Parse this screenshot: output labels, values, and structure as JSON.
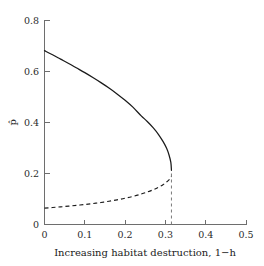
{
  "chart_data": {
    "type": "line",
    "title": "",
    "xlabel": "Increasing habitat destruction, 1−h",
    "ylabel": "p̂",
    "xlim": [
      0,
      0.5
    ],
    "ylim": [
      0,
      0.8
    ],
    "xticks": [
      0,
      0.1,
      0.2,
      0.3,
      0.4,
      0.5
    ],
    "xtick_labels": [
      "0",
      "0.1",
      "0.2",
      "0.3",
      "0.4",
      "0.5"
    ],
    "yticks": [
      0,
      0.2,
      0.4,
      0.6,
      0.8
    ],
    "ytick_labels": [
      "0",
      "0.2",
      "0.4",
      "0.6",
      "0.8"
    ],
    "grid": false,
    "legend": null,
    "annotations": [],
    "fold_point": {
      "x": 0.315,
      "y": 0.212
    },
    "series": [
      {
        "name": "stable equilibrium",
        "style": "solid",
        "color": "#1a1a1a",
        "x": [
          0.0,
          0.02,
          0.04,
          0.06,
          0.08,
          0.1,
          0.12,
          0.14,
          0.16,
          0.18,
          0.2,
          0.22,
          0.24,
          0.255,
          0.27,
          0.283,
          0.294,
          0.303,
          0.309,
          0.3135,
          0.315
        ],
        "y": [
          0.68,
          0.664,
          0.647,
          0.63,
          0.612,
          0.594,
          0.575,
          0.555,
          0.534,
          0.511,
          0.486,
          0.458,
          0.425,
          0.403,
          0.378,
          0.352,
          0.325,
          0.298,
          0.272,
          0.243,
          0.212
        ]
      },
      {
        "name": "unstable equilibrium",
        "style": "dashed",
        "color": "#1a1a1a",
        "x": [
          0.0,
          0.02,
          0.04,
          0.06,
          0.08,
          0.1,
          0.12,
          0.14,
          0.16,
          0.18,
          0.2,
          0.22,
          0.24,
          0.255,
          0.27,
          0.283,
          0.294,
          0.303,
          0.309,
          0.313,
          0.315
        ],
        "y": [
          0.064,
          0.0665,
          0.069,
          0.0718,
          0.0748,
          0.0782,
          0.082,
          0.0862,
          0.091,
          0.0965,
          0.1028,
          0.1102,
          0.1192,
          0.127,
          0.1362,
          0.146,
          0.1558,
          0.166,
          0.1748,
          0.182,
          0.1875
        ]
      },
      {
        "name": "fold threshold line",
        "style": "dashed-vertical",
        "color": "#7a7a7a",
        "x": [
          0.315,
          0.315
        ],
        "y": [
          0.0,
          0.2
        ]
      }
    ]
  },
  "axes": {
    "x_title": "Increasing habitat destruction, 1−h",
    "y_title": "p̂"
  }
}
